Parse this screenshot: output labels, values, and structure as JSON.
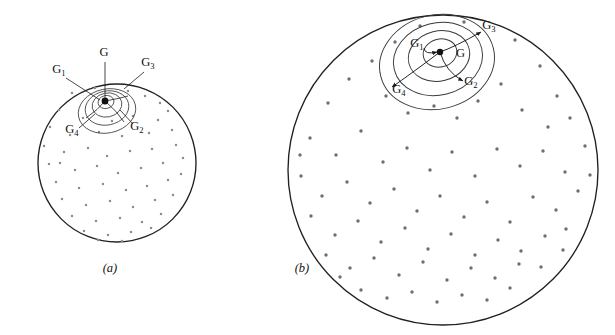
{
  "figure": {
    "background_color": "#ffffff",
    "width": 615,
    "height": 335,
    "line_color": "#231f20",
    "dot_color_a": "#8d8d92",
    "dot_color_b": "#6e6e74"
  },
  "panels": [
    {
      "id": "a",
      "caption": "(a)",
      "caption_x": 110,
      "caption_y": 272,
      "circle": {
        "cx": 117,
        "cy": 163,
        "r": 79
      },
      "center": {
        "cx": 105,
        "cy": 101
      },
      "rings": [
        {
          "rx": 8,
          "ry": 6.5,
          "cx": 106,
          "cy": 102,
          "rot": -12
        },
        {
          "rx": 15,
          "ry": 12,
          "cx": 107,
          "cy": 105,
          "rot": -12
        },
        {
          "rx": 22,
          "ry": 17,
          "cx": 107,
          "cy": 108,
          "rot": -12
        },
        {
          "rx": 29,
          "ry": 22,
          "cx": 107,
          "cy": 111,
          "rot": -12
        }
      ],
      "labels": [
        {
          "text": "G",
          "sub": "",
          "x": 104,
          "y": 56,
          "anchor": "middle"
        },
        {
          "text": "G",
          "sub": "1",
          "x": 59,
          "y": 73,
          "anchor": "middle"
        },
        {
          "text": "G",
          "sub": "2",
          "x": 137,
          "y": 130,
          "anchor": "middle"
        },
        {
          "text": "G",
          "sub": "3",
          "x": 148,
          "y": 66,
          "anchor": "middle"
        },
        {
          "text": "G",
          "sub": "4",
          "x": 72,
          "y": 133,
          "anchor": "middle"
        }
      ],
      "leaders": [
        {
          "from": [
            105,
            62
          ],
          "to": [
            105,
            98
          ]
        },
        {
          "from": [
            66,
            78
          ],
          "to": [
            100,
            100
          ]
        },
        {
          "from": [
            133,
            124
          ],
          "to": [
            120,
            110
          ]
        },
        {
          "from": [
            144,
            72
          ],
          "to": [
            124,
            89
          ]
        },
        {
          "from": [
            79,
            128
          ],
          "to": [
            95,
            114
          ]
        }
      ]
    },
    {
      "id": "b",
      "caption": "(b)",
      "caption_x": 302,
      "caption_y": 272,
      "circle": {
        "cx": 443,
        "cy": 170,
        "r": 155
      },
      "center": {
        "cx": 440,
        "cy": 52
      },
      "rings": [
        {
          "rx": 17,
          "ry": 14,
          "cx": 440,
          "cy": 53,
          "rot": -14
        },
        {
          "rx": 31,
          "ry": 25,
          "cx": 439,
          "cy": 56,
          "rot": -14
        },
        {
          "rx": 45,
          "ry": 36,
          "cx": 438,
          "cy": 59,
          "rot": -14
        },
        {
          "rx": 58,
          "ry": 47,
          "cx": 437,
          "cy": 62,
          "rot": -14
        }
      ],
      "labels": [
        {
          "text": "G",
          "sub": "",
          "x": 456,
          "y": 57,
          "anchor": "start"
        },
        {
          "text": "G",
          "sub": "1",
          "x": 417,
          "y": 47,
          "anchor": "middle"
        },
        {
          "text": "G",
          "sub": "2",
          "x": 471,
          "y": 85,
          "anchor": "middle"
        },
        {
          "text": "G",
          "sub": "3",
          "x": 489,
          "y": 29,
          "anchor": "middle"
        },
        {
          "text": "G",
          "sub": "4",
          "x": 399,
          "y": 93,
          "anchor": "middle"
        }
      ],
      "arrows": [
        {
          "from": [
            440,
            52
          ],
          "to": [
            481,
            32
          ]
        },
        {
          "from": [
            440,
            52
          ],
          "to": [
            463,
            81
          ]
        },
        {
          "from": [
            440,
            52
          ],
          "to": [
            392,
            87
          ]
        },
        {
          "from": [
            424,
            48
          ],
          "to": [
            437,
            52
          ]
        }
      ]
    }
  ],
  "scatter_a": [
    [
      72,
      93
    ],
    [
      95,
      88
    ],
    [
      128,
      91
    ],
    [
      145,
      96
    ],
    [
      160,
      103
    ],
    [
      59,
      110
    ],
    [
      83,
      118
    ],
    [
      112,
      121
    ],
    [
      133,
      116
    ],
    [
      158,
      120
    ],
    [
      168,
      111
    ],
    [
      50,
      127
    ],
    [
      70,
      135
    ],
    [
      99,
      132
    ],
    [
      122,
      136
    ],
    [
      149,
      133
    ],
    [
      172,
      130
    ],
    [
      44,
      146
    ],
    [
      64,
      152
    ],
    [
      88,
      148
    ],
    [
      107,
      156
    ],
    [
      130,
      151
    ],
    [
      152,
      149
    ],
    [
      176,
      145
    ],
    [
      49,
      164
    ],
    [
      75,
      170
    ],
    [
      97,
      166
    ],
    [
      118,
      173
    ],
    [
      141,
      168
    ],
    [
      163,
      163
    ],
    [
      183,
      158
    ],
    [
      56,
      182
    ],
    [
      79,
      188
    ],
    [
      103,
      184
    ],
    [
      126,
      190
    ],
    [
      147,
      186
    ],
    [
      168,
      180
    ],
    [
      62,
      199
    ],
    [
      86,
      205
    ],
    [
      110,
      201
    ],
    [
      133,
      207
    ],
    [
      155,
      200
    ],
    [
      173,
      195
    ],
    [
      72,
      216
    ],
    [
      96,
      221
    ],
    [
      120,
      218
    ],
    [
      142,
      222
    ],
    [
      161,
      214
    ],
    [
      84,
      231
    ],
    [
      108,
      235
    ],
    [
      131,
      232
    ],
    [
      151,
      228
    ],
    [
      98,
      240
    ],
    [
      122,
      241
    ],
    [
      60,
      163
    ],
    [
      181,
      174
    ]
  ],
  "scatter_b": [
    [
      372,
      61
    ],
    [
      395,
      42
    ],
    [
      420,
      26
    ],
    [
      464,
      22
    ],
    [
      515,
      40
    ],
    [
      540,
      66
    ],
    [
      557,
      96
    ],
    [
      328,
      103
    ],
    [
      349,
      79
    ],
    [
      386,
      96
    ],
    [
      408,
      113
    ],
    [
      434,
      106
    ],
    [
      457,
      118
    ],
    [
      478,
      101
    ],
    [
      501,
      84
    ],
    [
      522,
      110
    ],
    [
      548,
      127
    ],
    [
      570,
      118
    ],
    [
      310,
      138
    ],
    [
      336,
      155
    ],
    [
      361,
      131
    ],
    [
      383,
      162
    ],
    [
      407,
      148
    ],
    [
      430,
      170
    ],
    [
      452,
      152
    ],
    [
      475,
      176
    ],
    [
      497,
      149
    ],
    [
      520,
      166
    ],
    [
      543,
      151
    ],
    [
      565,
      172
    ],
    [
      585,
      146
    ],
    [
      301,
      176
    ],
    [
      322,
      196
    ],
    [
      347,
      182
    ],
    [
      370,
      203
    ],
    [
      394,
      189
    ],
    [
      417,
      211
    ],
    [
      440,
      196
    ],
    [
      464,
      217
    ],
    [
      487,
      202
    ],
    [
      510,
      222
    ],
    [
      533,
      197
    ],
    [
      556,
      210
    ],
    [
      578,
      191
    ],
    [
      311,
      216
    ],
    [
      335,
      235
    ],
    [
      358,
      221
    ],
    [
      381,
      242
    ],
    [
      405,
      228
    ],
    [
      428,
      249
    ],
    [
      451,
      234
    ],
    [
      475,
      255
    ],
    [
      498,
      240
    ],
    [
      521,
      251
    ],
    [
      545,
      236
    ],
    [
      566,
      229
    ],
    [
      326,
      255
    ],
    [
      350,
      268
    ],
    [
      374,
      258
    ],
    [
      399,
      275
    ],
    [
      423,
      262
    ],
    [
      447,
      280
    ],
    [
      471,
      268
    ],
    [
      495,
      278
    ],
    [
      519,
      264
    ],
    [
      541,
      267
    ],
    [
      361,
      290
    ],
    [
      387,
      298
    ],
    [
      412,
      292
    ],
    [
      437,
      302
    ],
    [
      462,
      295
    ],
    [
      487,
      300
    ],
    [
      510,
      288
    ],
    [
      340,
      277
    ],
    [
      563,
      250
    ],
    [
      300,
      155
    ],
    [
      590,
      175
    ]
  ]
}
